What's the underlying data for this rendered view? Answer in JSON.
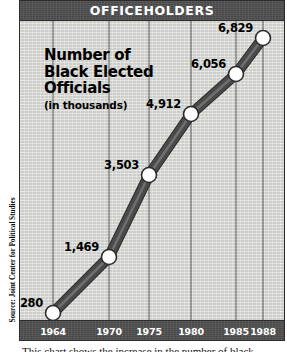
{
  "banner": {
    "title": "OFFICEHOLDERS"
  },
  "headline": {
    "line1": "Number of",
    "line2": "Black Elected",
    "line3": "Officials",
    "subtitle": "(in thousands)"
  },
  "source": {
    "text": "Source: Joint Center for Political Studies"
  },
  "caption": {
    "text": "This chart shows the increase in the number of black"
  },
  "colors": {
    "banner_background": "#4f4f4f",
    "banner_text": "#ffffff",
    "plot_background": "#d9d9d6",
    "line": "#4a4a4a",
    "line_highlight": "#6f6f6f",
    "marker_fill": "#ffffff",
    "marker_stroke": "#2b2b2b",
    "gridline": "#5a5a5a",
    "frame": "#2b2b2b",
    "label_text": "#000000"
  },
  "chart_data": {
    "type": "line",
    "title": "OFFICEHOLDERS",
    "subtitle": "Number of Black Elected Officials (in thousands)",
    "xlabel": "",
    "ylabel": "",
    "grid": "vertical",
    "legend": "none",
    "source": "Source: Joint Center for Political Studies",
    "categories": [
      "1964",
      "1970",
      "1975",
      "1980",
      "1985",
      "1988"
    ],
    "x": [
      1964,
      1970,
      1975,
      1980,
      1985,
      1988
    ],
    "values": [
      280,
      1469,
      3503,
      4912,
      6056,
      6829
    ],
    "value_labels": [
      "280",
      "1,469",
      "3,503",
      "4,912",
      "6,056",
      "6,829"
    ],
    "xlim": [
      1964,
      1988
    ],
    "ylim": [
      0,
      7400
    ],
    "points": [
      {
        "year": "1964",
        "label": "280",
        "value": 280,
        "px": 33,
        "py": 292
      },
      {
        "year": "1970",
        "label": "1,469",
        "value": 1469,
        "px": 89,
        "py": 236
      },
      {
        "year": "1975",
        "label": "3,503",
        "value": 3503,
        "px": 129,
        "py": 154
      },
      {
        "year": "1980",
        "label": "4,912",
        "value": 4912,
        "px": 171,
        "py": 93
      },
      {
        "year": "1985",
        "label": "6,056",
        "value": 6056,
        "px": 216,
        "py": 53
      },
      {
        "year": "1988",
        "label": "6,829",
        "value": 6829,
        "px": 243,
        "py": 17
      }
    ],
    "gridlines_px": [
      33,
      89,
      129,
      171,
      216,
      243
    ]
  }
}
